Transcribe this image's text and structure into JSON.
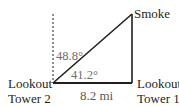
{
  "diagram": {
    "labels": {
      "smoke": "Smoke",
      "tower2_line1": "Lookout",
      "tower2_line2": "Tower 2",
      "tower1_line1": "Lookout",
      "tower1_line2": "Tower 1",
      "angle_from_north": "48.8°",
      "angle_from_base": "41.2°",
      "distance": "8.2 mi"
    },
    "colors": {
      "line": "#231f20",
      "dashed": "#231f20",
      "angle_text": "#6d6e71",
      "label_text": "#231f20"
    },
    "points": {
      "tower2": [
        53,
        83
      ],
      "tower1": [
        132,
        83
      ],
      "smoke": [
        132,
        14
      ],
      "north_top": [
        53,
        14
      ]
    }
  }
}
